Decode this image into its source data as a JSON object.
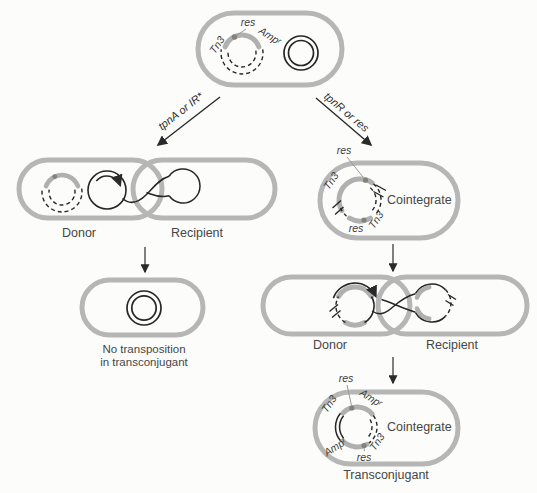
{
  "colors": {
    "cell_outline": "#b6b6b6",
    "transposon_arc": "#b0b0b0",
    "res_dot": "#82827a",
    "dna_line": "#262626"
  },
  "top_cell": {
    "res": "res",
    "tn3": "Tn3",
    "amp": "Ampʳ"
  },
  "branches": {
    "left": "tpnA or IR*",
    "right": "tpnR or res"
  },
  "left_pair": {
    "donor": "Donor",
    "recipient": "Recipient"
  },
  "no_transposition": {
    "line1": "No transposition",
    "line2": "in transconjugant"
  },
  "cointegrate_cell": {
    "res_top": "res",
    "tn3_upper": "Tn3",
    "tn3_lower": "Tn3",
    "res_bottom": "res",
    "label": "Cointegrate"
  },
  "right_pair": {
    "donor": "Donor",
    "recipient": "Recipient"
  },
  "transconjugant": {
    "res_top": "res",
    "tn3_upper": "Tn3",
    "amp_upper": "Ampʳ",
    "amp_lower": "Ampʳ",
    "tn3_lower": "Tn3",
    "res_bottom": "res",
    "label": "Cointegrate",
    "caption": "Transconjugant"
  }
}
